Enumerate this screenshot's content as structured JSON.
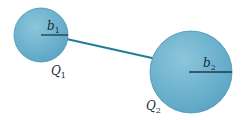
{
  "diagram": {
    "colors": {
      "sphere_fill": "#6fb3cf",
      "sphere_edge": "#4a93b3",
      "wire": "#1f7f93",
      "radius_line": "#1c3a4a",
      "label": "#1a2a35"
    },
    "sphere1": {
      "radius_label_base": "b",
      "radius_label_sub": "1",
      "charge_label_base": "Q",
      "charge_label_sub": "1"
    },
    "sphere2": {
      "radius_label_base": "b",
      "radius_label_sub": "2",
      "charge_label_base": "Q",
      "charge_label_sub": "2"
    }
  }
}
